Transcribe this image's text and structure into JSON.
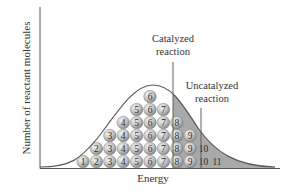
{
  "figure": {
    "y_axis_label": "Number of reactant molecules",
    "x_axis_label": "Energy",
    "catalyzed_label_line1": "Catalyzed",
    "catalyzed_label_line2": "reaction",
    "uncatalyzed_label_line1": "Uncatalyzed",
    "uncatalyzed_label_line2": "reaction"
  },
  "colors": {
    "axis": "#555555",
    "curve": "#5a5a5a",
    "shade": "#a9a9a9",
    "ball_light": "#e8e8e8",
    "ball_dark": "#8c8c8c",
    "text": "#333333"
  },
  "chart_data": {
    "type": "distribution",
    "title": "",
    "xlabel": "Energy",
    "ylabel": "Number of reactant molecules",
    "columns": [
      {
        "energy_level": 1,
        "count": 1
      },
      {
        "energy_level": 2,
        "count": 2
      },
      {
        "energy_level": 3,
        "count": 3
      },
      {
        "energy_level": 4,
        "count": 4
      },
      {
        "energy_level": 5,
        "count": 5
      },
      {
        "energy_level": 6,
        "count": 6
      },
      {
        "energy_level": 7,
        "count": 5
      },
      {
        "energy_level": 8,
        "count": 4
      },
      {
        "energy_level": 9,
        "count": 3
      },
      {
        "energy_level": 10,
        "count": 2
      },
      {
        "energy_level": 11,
        "count": 1
      }
    ],
    "thresholds": [
      {
        "name": "Catalyzed reaction",
        "between_levels": [
          7,
          8
        ]
      },
      {
        "name": "Uncatalyzed reaction",
        "between_levels": [
          9,
          10
        ]
      }
    ],
    "shaded_region": "energies above catalyzed threshold"
  }
}
